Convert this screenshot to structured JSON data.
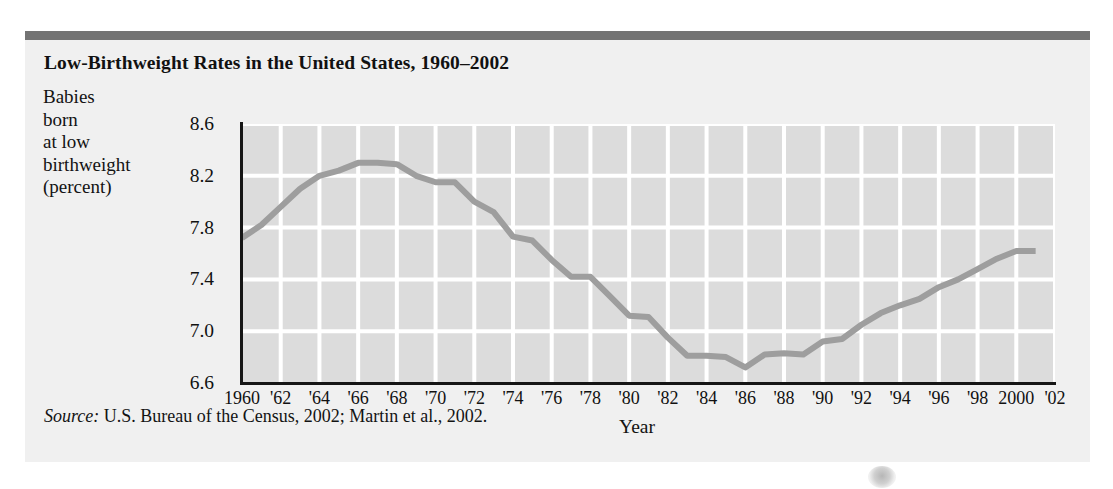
{
  "figure": {
    "title": "Low-Birthweight Rates in the United States, 1960–2002",
    "y_caption_lines": [
      "Babies",
      "born",
      "at low",
      "birthweight",
      "(percent)"
    ],
    "x_axis_title": "Year",
    "source_label": "Source:",
    "source_text": " U.S. Bureau of the Census, 2002; Martin et al., 2002.",
    "accent_bar_color": "#737373",
    "plot_background_color": "#dcdcdc",
    "gridline_color": "#ffffff",
    "line_color": "#9e9e9e",
    "axis_color": "#161616"
  },
  "chart_data": {
    "type": "line",
    "title": "Low-Birthweight Rates in the United States, 1960–2002",
    "xlabel": "Year",
    "ylabel": "Babies born at low birthweight (percent)",
    "xlim": [
      1960,
      2002
    ],
    "ylim": [
      6.6,
      8.6
    ],
    "yticks": [
      8.6,
      8.2,
      7.8,
      7.4,
      7.0,
      6.6
    ],
    "ytick_labels": [
      "8.6",
      "8.2",
      "7.8",
      "7.4",
      "7.0",
      "6.6"
    ],
    "xticks": [
      1960,
      1962,
      1964,
      1966,
      1968,
      1970,
      1972,
      1974,
      1976,
      1978,
      1980,
      1982,
      1984,
      1986,
      1988,
      1990,
      1992,
      1994,
      1996,
      1998,
      2000,
      2002
    ],
    "xtick_labels": [
      "1960",
      "'62",
      "'64",
      "'66",
      "'68",
      "'70",
      "'72",
      "'74",
      "'76",
      "'78",
      "'80",
      "'82",
      "'84",
      "'86",
      "'88",
      "'90",
      "'92",
      "'94",
      "'96",
      "'98",
      "2000",
      "'02"
    ],
    "grid": true,
    "legend": "none",
    "series": [
      {
        "name": "Low-birthweight rate",
        "x": [
          1960,
          1961,
          1962,
          1963,
          1964,
          1965,
          1966,
          1967,
          1968,
          1969,
          1970,
          1971,
          1972,
          1973,
          1974,
          1975,
          1976,
          1977,
          1978,
          1979,
          1980,
          1981,
          1982,
          1983,
          1984,
          1985,
          1986,
          1987,
          1988,
          1989,
          1990,
          1991,
          1992,
          1993,
          1994,
          1995,
          1996,
          1997,
          1998,
          1999,
          2000,
          2001
        ],
        "values": [
          7.72,
          7.82,
          7.96,
          8.1,
          8.2,
          8.24,
          8.3,
          8.3,
          8.29,
          8.2,
          8.15,
          8.15,
          8.0,
          7.92,
          7.73,
          7.7,
          7.55,
          7.42,
          7.42,
          7.27,
          7.12,
          7.11,
          6.95,
          6.81,
          6.81,
          6.8,
          6.72,
          6.82,
          6.83,
          6.82,
          6.92,
          6.94,
          7.05,
          7.14,
          7.2,
          7.25,
          7.34,
          7.4,
          7.48,
          7.56,
          7.62,
          7.62
        ]
      }
    ]
  }
}
